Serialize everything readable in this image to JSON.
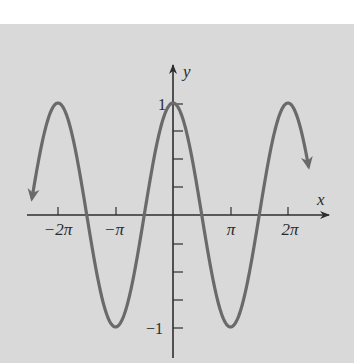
{
  "chart_data": {
    "type": "line",
    "title": "",
    "function": "y = cos(x)",
    "xlabel": "x",
    "ylabel": "y",
    "x_ticks": [
      {
        "value": -6.2832,
        "label": "−2π"
      },
      {
        "value": -3.1416,
        "label": "−π"
      },
      {
        "value": 3.1416,
        "label": "π"
      },
      {
        "value": 6.2832,
        "label": "2π"
      }
    ],
    "y_ticks": [
      {
        "value": 1,
        "label": "1"
      },
      {
        "value": 0.75,
        "label": ""
      },
      {
        "value": 0.5,
        "label": ""
      },
      {
        "value": 0.25,
        "label": ""
      },
      {
        "value": -0.25,
        "label": ""
      },
      {
        "value": -0.5,
        "label": ""
      },
      {
        "value": -0.75,
        "label": ""
      },
      {
        "value": -1,
        "label": "−1"
      }
    ],
    "xlim": [
      -8.1,
      8.4
    ],
    "ylim": [
      -1.3,
      1.4
    ],
    "grid": false,
    "legend": "none",
    "curve_range": [
      -7.7,
      7.4
    ],
    "curve_end_arrows": true,
    "series": [
      {
        "name": "cos(x)",
        "x": [
          -7.7,
          -6.2832,
          -4.7124,
          -3.1416,
          -1.5708,
          0,
          1.5708,
          3.1416,
          4.7124,
          6.2832,
          7.4
        ],
        "values": [
          0.16,
          1,
          0,
          -1,
          0,
          1,
          0,
          -1,
          0,
          1,
          0.44
        ]
      }
    ],
    "colors": {
      "curve": "#6a6a6a",
      "axes": "#2e2e2e",
      "background": "#d9d9d9"
    }
  },
  "labels": {
    "x_axis": "x",
    "y_axis": "y",
    "xt_m2pi": "−2π",
    "xt_mpi": "−π",
    "xt_pi": "π",
    "xt_2pi": "2π",
    "yt_1": "1",
    "yt_m1": "−1"
  }
}
